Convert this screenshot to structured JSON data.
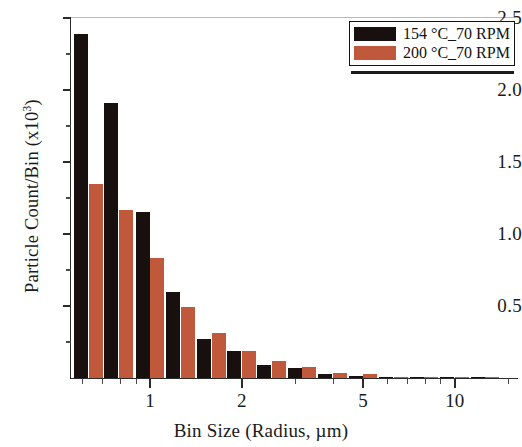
{
  "chart_data": {
    "type": "bar",
    "title": "",
    "xlabel": "Bin Size (Radius, µm)",
    "ylabel": "Particle Count/Bin (x10³)",
    "ylabel_base": "Particle Count/Bin (x10",
    "ylabel_exp": "3",
    "ylabel_tail": ")",
    "xscale": "log",
    "yscale": "linear",
    "xlim": [
      0.55,
      16.0
    ],
    "ylim": [
      0,
      2.5
    ],
    "grid": false,
    "legend_position": "top-right",
    "y_ticks": [
      0.5,
      1.0,
      1.5,
      2.0,
      2.5
    ],
    "y_tick_labels": [
      "0.5",
      "1.0",
      "1.5",
      "2.0",
      "2.5"
    ],
    "y_minor_ticks": [
      0.25,
      0.75,
      1.25,
      1.75,
      2.25
    ],
    "x_ticks": [
      1,
      2,
      5,
      10
    ],
    "x_tick_labels": [
      "1",
      "2",
      "5",
      "10"
    ],
    "x_minor_ticks": [
      0.6,
      0.7,
      0.8,
      0.9,
      3,
      4,
      6,
      7,
      8,
      9,
      15
    ],
    "bin_centers": [
      0.63,
      0.79,
      1.0,
      1.26,
      1.59,
      2.0,
      2.51,
      3.16,
      3.98,
      5.01,
      6.31,
      7.94,
      10.0,
      12.6
    ],
    "bin_labels": [
      "0.63",
      "0.79",
      "1.00",
      "1.26",
      "1.59",
      "2.00",
      "2.51",
      "3.16",
      "3.98",
      "5.01",
      "6.31",
      "7.94",
      "10.0",
      "12.6"
    ],
    "categories": [
      "0.63",
      "0.79",
      "1.00",
      "1.26",
      "1.59",
      "2.00",
      "2.51",
      "3.16",
      "3.98",
      "5.01",
      "6.31",
      "7.94",
      "10.0",
      "12.6"
    ],
    "series": [
      {
        "name": "154 °C_70 RPM",
        "color": "#17100e",
        "values": [
          2.39,
          1.91,
          1.15,
          0.6,
          0.27,
          0.19,
          0.09,
          0.07,
          0.025,
          0.012,
          0.008,
          0.004,
          0.003,
          0.002
        ]
      },
      {
        "name": "200 °C_70 RPM",
        "color": "#c0583c",
        "values": [
          1.35,
          1.17,
          0.83,
          0.49,
          0.31,
          0.185,
          0.115,
          0.075,
          0.035,
          0.03,
          0.01,
          0.006,
          0.004,
          0.002
        ]
      }
    ]
  },
  "legend": {
    "entries": [
      {
        "label": "154 °C_70 RPM",
        "color": "#17100e"
      },
      {
        "label": "200 °C_70 RPM",
        "color": "#c0583c"
      }
    ]
  },
  "axes": {
    "y_title": "Particle Count/Bin (x10",
    "y_title_exp": "3",
    "y_title_close": ")",
    "x_title": "Bin Size (Radius, µm)"
  }
}
